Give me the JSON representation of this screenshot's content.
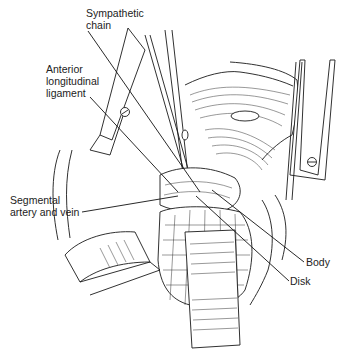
{
  "figure": {
    "type": "surgical anatomical line illustration",
    "labels": [
      {
        "id": "sympathetic-chain",
        "text": "Sympathetic\nchain",
        "x": 86,
        "y": 8,
        "pointer": [
          [
            88,
            30
          ],
          [
            200,
            192
          ]
        ]
      },
      {
        "id": "anterior-longitudinal-ligament",
        "text": "Anterior\nlongitudinal\nligament",
        "x": 46,
        "y": 64,
        "pointer": [
          [
            90,
            96
          ],
          [
            178,
            192
          ]
        ]
      },
      {
        "id": "segmental-artery-and-vein",
        "text": "Segmental\nartery and vein",
        "x": 10,
        "y": 195,
        "pointer": [
          [
            80,
            211
          ],
          [
            176,
            196
          ]
        ]
      },
      {
        "id": "body",
        "text": "Body",
        "x": 305,
        "y": 259,
        "pointer": [
          [
            304,
            262
          ],
          [
            212,
            190
          ]
        ]
      },
      {
        "id": "disk",
        "text": "Disk",
        "x": 289,
        "y": 278,
        "pointer": [
          [
            289,
            281
          ],
          [
            196,
            196
          ]
        ]
      }
    ]
  },
  "colors": {
    "line": "#1a1a1a",
    "background": "#ffffff",
    "text": "#222222"
  }
}
